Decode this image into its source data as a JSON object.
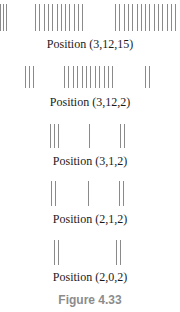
{
  "figure": {
    "caption": "Figure 4.33",
    "stick_color": "#8a8a8a",
    "caption_color": "#8c8c8c",
    "rows": [
      {
        "label": "Position (3,12,15)",
        "heaps": [
          3,
          12,
          15
        ],
        "stick_top": 4,
        "stick_height": 27,
        "label_top": 37,
        "groups": [
          {
            "count": 3,
            "start_x": 0,
            "spacing": 3
          },
          {
            "count": 12,
            "start_x": 35,
            "spacing": 4.3
          },
          {
            "count": 15,
            "start_x": 115,
            "spacing": 4.3
          }
        ]
      },
      {
        "label": "Position (3,12,2)",
        "heaps": [
          3,
          12,
          2
        ],
        "stick_top": 66,
        "stick_height": 22,
        "label_top": 95,
        "groups": [
          {
            "count": 3,
            "start_x": 25,
            "spacing": 4
          },
          {
            "count": 12,
            "start_x": 64,
            "spacing": 4.4
          },
          {
            "count": 2,
            "start_x": 145,
            "spacing": 4
          }
        ]
      },
      {
        "label": "Position (3,1,2)",
        "heaps": [
          3,
          1,
          2
        ],
        "stick_top": 124,
        "stick_height": 24,
        "label_top": 154,
        "groups": [
          {
            "count": 3,
            "start_x": 50,
            "spacing": 4
          },
          {
            "count": 1,
            "start_x": 89,
            "spacing": 4
          },
          {
            "count": 2,
            "start_x": 120,
            "spacing": 4
          }
        ]
      },
      {
        "label": "Position (2,1,2)",
        "heaps": [
          2,
          1,
          2
        ],
        "stick_top": 181,
        "stick_height": 25,
        "label_top": 212,
        "groups": [
          {
            "count": 2,
            "start_x": 51,
            "spacing": 4
          },
          {
            "count": 1,
            "start_x": 88,
            "spacing": 4
          },
          {
            "count": 2,
            "start_x": 119,
            "spacing": 4
          }
        ]
      },
      {
        "label": "Position (2,0,2)",
        "heaps": [
          2,
          0,
          2
        ],
        "stick_top": 240,
        "stick_height": 25,
        "label_top": 270,
        "groups": [
          {
            "count": 2,
            "start_x": 54,
            "spacing": 4
          },
          {
            "count": 2,
            "start_x": 116,
            "spacing": 4
          }
        ]
      }
    ]
  }
}
